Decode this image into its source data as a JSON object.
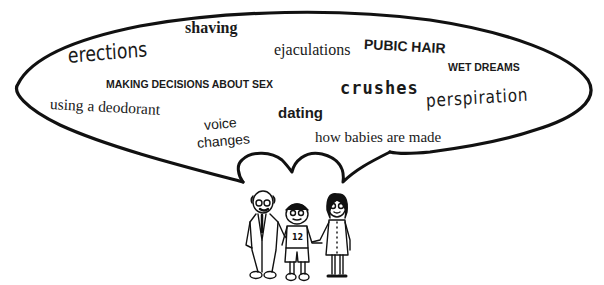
{
  "bubble": {
    "stroke_color": "#111111",
    "topics": [
      {
        "id": "shaving",
        "text": "shaving"
      },
      {
        "id": "erections",
        "text": "erections"
      },
      {
        "id": "ejaculations",
        "text": "ejaculations"
      },
      {
        "id": "pubic-hair",
        "text": "PUBIC HAIR"
      },
      {
        "id": "making-decisions",
        "text": "MAKING DECISIONS ABOUT SEX"
      },
      {
        "id": "wet-dreams",
        "text": "WET DREAMS"
      },
      {
        "id": "crushes",
        "text": "crushes"
      },
      {
        "id": "using-deodorant",
        "text": "using a deodorant"
      },
      {
        "id": "perspiration",
        "text": "perspiration"
      },
      {
        "id": "dating",
        "text": "dating"
      },
      {
        "id": "voice",
        "text": "voice"
      },
      {
        "id": "changes",
        "text": "changes"
      },
      {
        "id": "how-babies",
        "text": "how babies are made"
      }
    ]
  },
  "figures": {
    "boy_shirt_number": "12",
    "people": [
      "older-man",
      "boy",
      "woman"
    ]
  }
}
